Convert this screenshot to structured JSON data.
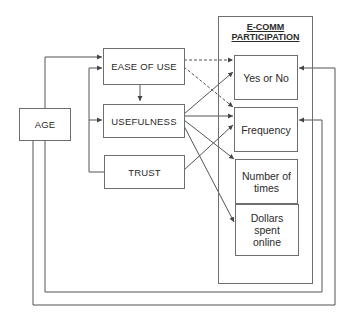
{
  "diagram": {
    "predictor": {
      "age": "AGE"
    },
    "mediators": {
      "ease_of_use": "EASE OF USE",
      "usefulness": "USEFULNESS",
      "trust": "TRUST"
    },
    "outcome_group": {
      "title_line1": "E-COMM",
      "title_line2": "PARTICIPATION",
      "outcomes": {
        "yes_or_no": "Yes or No",
        "frequency": "Frequency",
        "number_of_times_line1": "Number of",
        "number_of_times_line2": "times",
        "dollars_line1": "Dollars",
        "dollars_line2": "spent",
        "dollars_line3": "online"
      }
    },
    "edges": [
      {
        "from": "AGE",
        "to": "EASE OF USE",
        "style": "solid"
      },
      {
        "from": "AGE",
        "to": "Yes or No",
        "style": "solid"
      },
      {
        "from": "AGE",
        "to": "Frequency",
        "style": "solid"
      },
      {
        "from": "TRUST",
        "to": "EASE OF USE",
        "style": "solid"
      },
      {
        "from": "TRUST",
        "to": "USEFULNESS",
        "style": "solid"
      },
      {
        "from": "EASE OF USE",
        "to": "USEFULNESS",
        "style": "solid"
      },
      {
        "from": "EASE OF USE",
        "to": "Yes or No",
        "style": "dashed"
      },
      {
        "from": "EASE OF USE",
        "to": "Frequency",
        "style": "dashed"
      },
      {
        "from": "USEFULNESS",
        "to": "Yes or No",
        "style": "solid"
      },
      {
        "from": "USEFULNESS",
        "to": "Frequency",
        "style": "solid"
      },
      {
        "from": "USEFULNESS",
        "to": "Number of times",
        "style": "solid"
      },
      {
        "from": "USEFULNESS",
        "to": "Dollars spent online",
        "style": "solid"
      },
      {
        "from": "TRUST",
        "to": "Frequency",
        "style": "solid"
      }
    ],
    "colors": {
      "line": "#555555",
      "border": "#6e6e6e",
      "text": "#2a2a2a"
    }
  }
}
